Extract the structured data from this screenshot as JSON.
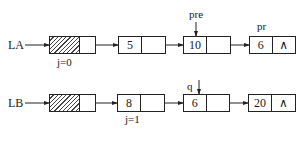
{
  "diagram": {
    "type": "linked-list-diagram",
    "lists": [
      {
        "name": "LA",
        "head_index_label": "j=0",
        "nodes": [
          {
            "value": "5",
            "next": "ptr"
          },
          {
            "value": "10",
            "next": "ptr",
            "pointer_label": "pre"
          },
          {
            "value": "6",
            "next": "null",
            "pointer_label": "pr"
          }
        ]
      },
      {
        "name": "LB",
        "nodes": [
          {
            "value": "8",
            "next": "ptr",
            "index_label": "j=1"
          },
          {
            "value": "6",
            "next": "ptr",
            "pointer_label": "q"
          },
          {
            "value": "20",
            "next": "null"
          }
        ]
      }
    ],
    "null_symbol": "∧",
    "caption": ""
  },
  "labels": {
    "la": "LA",
    "lb": "LB",
    "j0": "j=0",
    "j1": "j=1",
    "pre": "pre",
    "pr": "pr",
    "q": "q"
  },
  "values": {
    "la_1": "5",
    "la_2": "10",
    "la_3": "6",
    "lb_1": "8",
    "lb_2": "6",
    "lb_3": "20",
    "null": "∧"
  },
  "colors": {
    "line": "#222222",
    "text": "#1a1a1a",
    "background": "#ffffff"
  }
}
